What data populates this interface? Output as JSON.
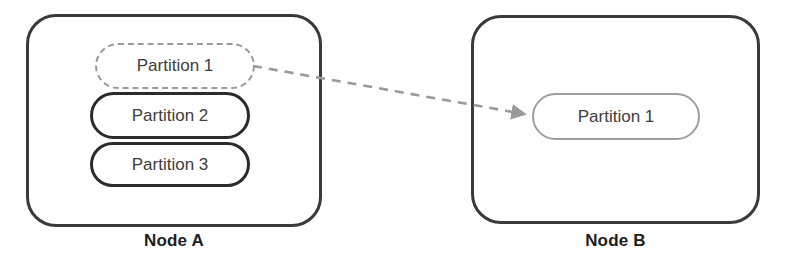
{
  "diagram": {
    "background_color": "#ffffff"
  },
  "nodes": [
    {
      "id": "node-a",
      "caption": "Node A",
      "border_color": "#3a3a3a",
      "partitions": [
        {
          "label": "Partition 1",
          "style": "dashed",
          "color": "#9a9a9a",
          "state": "migrating-out"
        },
        {
          "label": "Partition 2",
          "style": "solid",
          "color": "#2b2b2b",
          "state": "resident"
        },
        {
          "label": "Partition 3",
          "style": "solid",
          "color": "#2b2b2b",
          "state": "resident"
        }
      ]
    },
    {
      "id": "node-b",
      "caption": "Node B",
      "border_color": "#3a3a3a",
      "partitions": [
        {
          "label": "Partition 1",
          "style": "solid",
          "color": "#9e9e9e",
          "state": "migrating-in"
        }
      ]
    }
  ],
  "arrow": {
    "name": "migration-arrow",
    "color": "#9a9a9a",
    "style": "dashed",
    "from": {
      "x": 253,
      "y": 66
    },
    "to": {
      "x": 531,
      "y": 115
    },
    "head": "filled-triangle"
  }
}
